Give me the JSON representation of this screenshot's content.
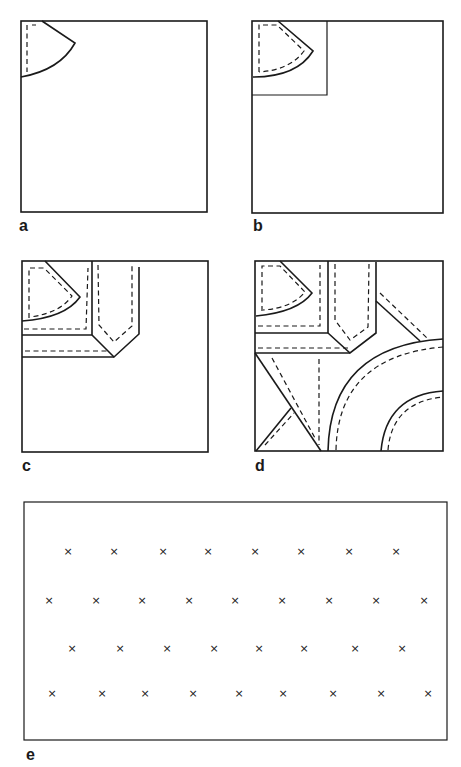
{
  "figure": {
    "panels": [
      {
        "id": "a",
        "label": "a",
        "description": "Square with quarter-circle pattern piece in top-left corner"
      },
      {
        "id": "b",
        "label": "b",
        "description": "Quarter-circle piece enclosed in small corner square"
      },
      {
        "id": "c",
        "label": "c",
        "description": "Added strip pieces with pointed end"
      },
      {
        "id": "d",
        "label": "d",
        "description": "Full layout with diagonal strips and large arcs"
      },
      {
        "id": "e",
        "label": "e",
        "description": "Rectangle with staggered rows of cross marks"
      }
    ],
    "crosses": {
      "symbol": "×",
      "rows": [
        {
          "y": 551,
          "x": [
            68,
            114,
            163,
            208,
            255,
            301,
            349,
            396
          ]
        },
        {
          "y": 600,
          "x": [
            49,
            96,
            142,
            189,
            235,
            282,
            329,
            376,
            424
          ]
        },
        {
          "y": 648,
          "x": [
            72,
            120,
            167,
            214,
            259,
            304,
            355,
            402
          ]
        },
        {
          "y": 693,
          "x": [
            52,
            102,
            145,
            193,
            239,
            283,
            333,
            381,
            428
          ]
        }
      ]
    }
  }
}
